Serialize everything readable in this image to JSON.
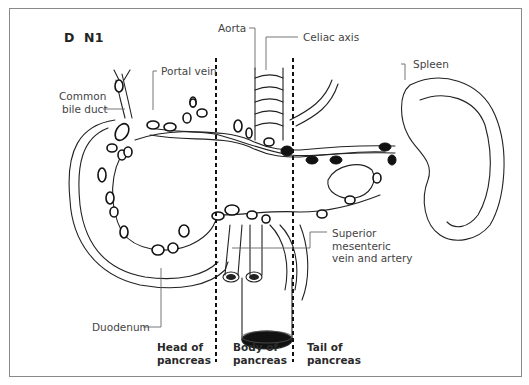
{
  "figure": {
    "panel_letter": "D",
    "panel_code": "N1",
    "labels": {
      "aorta": "Aorta",
      "celiac_axis": "Celiac axis",
      "spleen": "Spleen",
      "portal_vein": "Portal vein",
      "common_bile_duct_line1": "Common",
      "common_bile_duct_line2": "bile duct",
      "duodenum": "Duodenum",
      "sma_line1": "Superior",
      "sma_line2": "mesenteric",
      "sma_line3": "vein and artery"
    },
    "regions": [
      {
        "line1": "Head of",
        "line2": "pancreas"
      },
      {
        "line1": "Body of",
        "line2": "pancreas"
      },
      {
        "line1": "Tail of",
        "line2": "pancreas"
      }
    ],
    "colors": {
      "frame": "#8a8a8a",
      "ink": "#1a1a1a",
      "label": "#444444",
      "node_filled": "#111111"
    }
  }
}
